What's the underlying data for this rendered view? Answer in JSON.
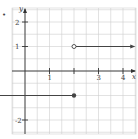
{
  "chart_data": {
    "type": "line",
    "title": "",
    "xlabel": "x",
    "ylabel": "y",
    "xlim": [
      -1.75,
      4.5
    ],
    "ylim": [
      -5,
      5
    ],
    "grid": true,
    "grid_step": 0.5,
    "x_ticks": [
      1,
      2,
      3,
      4
    ],
    "x_tick_labels": [
      "1",
      "",
      "3",
      "4"
    ],
    "y_ticks": [
      -4,
      -3,
      -2,
      -1,
      1,
      2,
      3,
      4
    ],
    "y_tick_labels": [
      "-4",
      "-3",
      "-2",
      "",
      "1",
      "2",
      "3",
      "4"
    ],
    "series": [
      {
        "name": "upper piece",
        "description": "y = 1 for x > 2",
        "start": {
          "x": 2,
          "y": 1,
          "endpoint": "open"
        },
        "direction": "right",
        "points": [
          [
            2,
            1
          ],
          [
            4.5,
            1
          ]
        ]
      },
      {
        "name": "lower piece",
        "description": "y = -1 for x <= 2",
        "start": {
          "x": 2,
          "y": -1,
          "endpoint": "closed"
        },
        "direction": "left",
        "points": [
          [
            2,
            -1
          ],
          [
            -1.75,
            -1
          ]
        ]
      }
    ],
    "colors": {
      "grid": "#cfcfcf",
      "axis": "#333333",
      "curve": "#444444"
    }
  },
  "labels": {
    "x_axis": "x",
    "y_axis": "y",
    "marker": "•"
  }
}
